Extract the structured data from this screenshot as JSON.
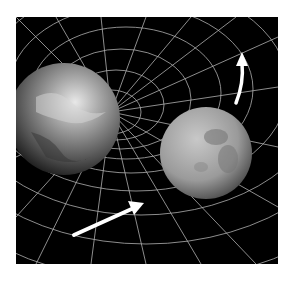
{
  "image": {
    "subject": "Spacetime curvature illustration: Earth warping a grid with the Moon orbiting",
    "elements": [
      "earth",
      "moon",
      "spacetime-grid",
      "orbit-arrow-lower",
      "orbit-arrow-upper"
    ],
    "colors": {
      "background": "#000000",
      "grid": "#d8d8d8",
      "arrow": "#ffffff",
      "page": "#ffffff"
    }
  }
}
